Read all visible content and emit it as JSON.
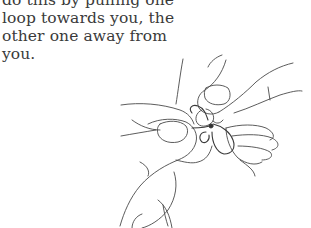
{
  "document": {
    "text_lines": [
      "do this by pulling one",
      "loop towards you, the",
      "other one away from",
      "you."
    ]
  },
  "illustration": {
    "description": "Line drawing of two hands pulling a small cord loop, one loop towards the viewer and the other away",
    "icon": "hands-tying-loop-illustration",
    "stroke_color": "#4a4a4a"
  },
  "colors": {
    "background": "#ffffff",
    "text": "#3a3a3a"
  }
}
